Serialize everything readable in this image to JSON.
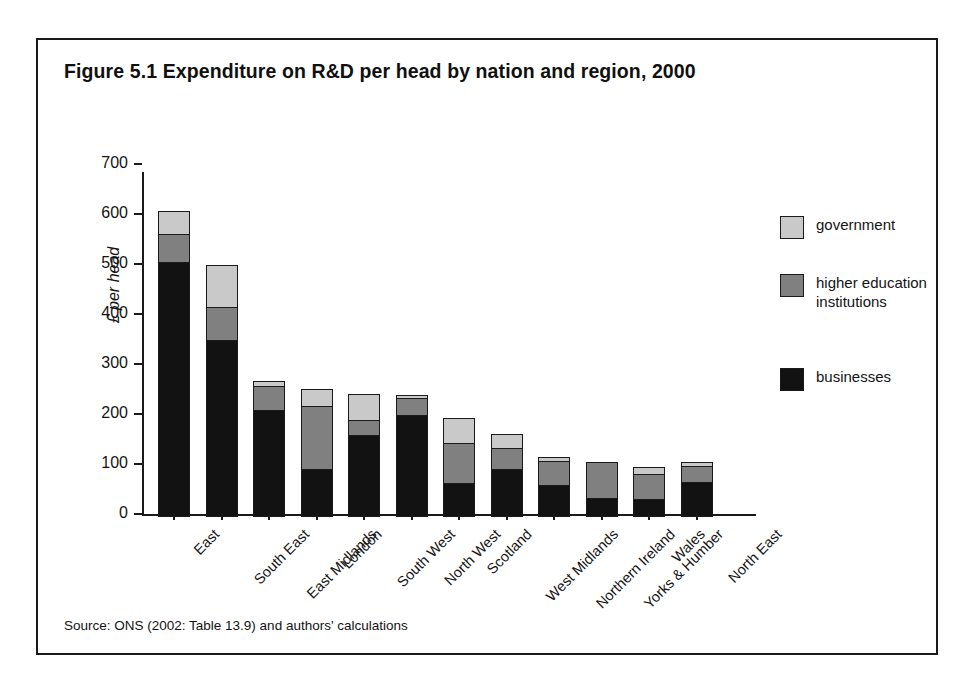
{
  "figure": {
    "title": "Figure 5.1 Expenditure on R&D per head by nation and region, 2000",
    "source": "Source: ONS (2002: Table 13.9) and authors' calculations"
  },
  "legend": {
    "position": "right",
    "items": [
      {
        "label": "government",
        "key": "government",
        "color": "#c9c9c9"
      },
      {
        "label": "higher education institutions",
        "key": "higher_education",
        "color": "#808080"
      },
      {
        "label": "businesses",
        "key": "businesses",
        "color": "#121212"
      }
    ]
  },
  "axes": {
    "ylabel": "£ per head",
    "yticks": [
      "700",
      "600",
      "500",
      "400",
      "300",
      "200",
      "100",
      "0"
    ]
  },
  "chart_data": {
    "type": "bar",
    "stacked": true,
    "title": "Figure 5.1 Expenditure on R&D per head by nation and region, 2000",
    "xlabel": "",
    "ylabel": "£ per head",
    "ylim": [
      0,
      700
    ],
    "ytick_step": 100,
    "grid": false,
    "legend_position": "right",
    "categories": [
      "East",
      "South East",
      "East Midlands",
      "London",
      "South West",
      "North West",
      "Scotland",
      "West Midlands",
      "Northern Ireland",
      "Yorks & Humber",
      "Wales",
      "North East"
    ],
    "series": [
      {
        "name": "businesses",
        "color": "#121212",
        "values": [
          510,
          355,
          214,
          96,
          165,
          205,
          68,
          96,
          65,
          38,
          37,
          70
        ]
      },
      {
        "name": "higher education institutions",
        "color": "#808080",
        "values": [
          58,
          68,
          50,
          129,
          31,
          35,
          83,
          45,
          50,
          75,
          51,
          35
        ]
      },
      {
        "name": "government",
        "color": "#c9c9c9",
        "values": [
          48,
          85,
          12,
          35,
          55,
          9,
          52,
          30,
          10,
          0,
          17,
          10
        ]
      }
    ],
    "totals": [
      616,
      508,
      276,
      260,
      251,
      249,
      203,
      171,
      125,
      113,
      105,
      115
    ]
  }
}
